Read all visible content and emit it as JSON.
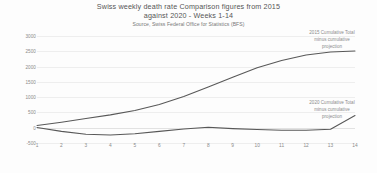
{
  "chart_data": {
    "type": "line",
    "title": "Swiss weekly death rate  Comparison figures from 2015",
    "title_line2": "against 2020 - Weeks 1-14",
    "subtitle": "Source, Swiss Federal Office for Statistics (BFS)",
    "xlabel": "",
    "ylabel": "",
    "x": [
      1,
      2,
      3,
      4,
      5,
      6,
      7,
      8,
      9,
      10,
      11,
      12,
      13,
      14
    ],
    "categories": [
      "1",
      "2",
      "3",
      "4",
      "5",
      "6",
      "7",
      "8",
      "9",
      "10",
      "11",
      "12",
      "13",
      "14"
    ],
    "ylim": [
      -500,
      3000
    ],
    "yticks": [
      3000,
      2500,
      2000,
      1500,
      1000,
      500,
      0,
      -500
    ],
    "ytick_labels": [
      "3000",
      "2500",
      "2000",
      "1500",
      "1000",
      "500",
      "0",
      "-500"
    ],
    "grid": true,
    "legend_position": "none",
    "series": [
      {
        "name": "2015 Cumulative Total minus cumulative projection",
        "values": [
          75,
          180,
          300,
          420,
          560,
          760,
          1020,
          1330,
          1650,
          1960,
          2200,
          2380,
          2480,
          2510
        ]
      },
      {
        "name": "2020 Cumulative Total minus cumulative projection",
        "values": [
          10,
          -120,
          -215,
          -235,
          -200,
          -120,
          -40,
          15,
          -30,
          -60,
          -80,
          -85,
          -50,
          400
        ]
      }
    ],
    "annotations": [
      {
        "id": "annotation-2015",
        "line1": "2015 Cumulative Total",
        "line2": "minus cumulative",
        "line3": "projection"
      },
      {
        "id": "annotation-2020",
        "line1": "2020 Cumulative Total",
        "line2": "minus cumulative",
        "line3": "projection"
      }
    ],
    "colors": {
      "series_line": "#585858",
      "gridline": "#eeeeee",
      "axis_text": "#8a8a8a",
      "title_text": "#555555",
      "background": "#fdfdfd"
    }
  }
}
